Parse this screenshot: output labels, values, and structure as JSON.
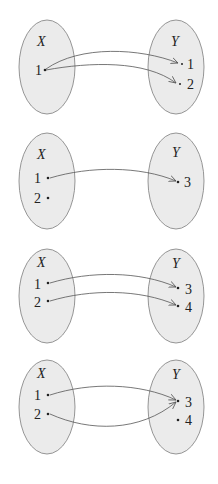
{
  "diagrams": [
    {
      "name": "mapping-1",
      "domain_label": "X",
      "codomain_label": "Y",
      "domain_elements": [
        "1"
      ],
      "codomain_elements": [
        "1",
        "2"
      ],
      "arrows": [
        [
          "1",
          "1"
        ],
        [
          "1",
          "2"
        ]
      ]
    },
    {
      "name": "mapping-2",
      "domain_label": "X",
      "codomain_label": "Y",
      "domain_elements": [
        "1",
        "2"
      ],
      "codomain_elements": [
        "3"
      ],
      "arrows": [
        [
          "1",
          "3"
        ]
      ]
    },
    {
      "name": "mapping-3",
      "domain_label": "X",
      "codomain_label": "Y",
      "domain_elements": [
        "1",
        "2"
      ],
      "codomain_elements": [
        "3",
        "4"
      ],
      "arrows": [
        [
          "1",
          "3"
        ],
        [
          "2",
          "4"
        ]
      ]
    },
    {
      "name": "mapping-4",
      "domain_label": "X",
      "codomain_label": "Y",
      "domain_elements": [
        "1",
        "2"
      ],
      "codomain_elements": [
        "3",
        "4"
      ],
      "arrows": [
        [
          "1",
          "3"
        ],
        [
          "2",
          "3"
        ]
      ]
    }
  ],
  "colors": {
    "ellipse_fill": "#ebebeb",
    "ellipse_stroke": "#8a8a8a",
    "arrow": "#555555",
    "text": "#222222"
  }
}
